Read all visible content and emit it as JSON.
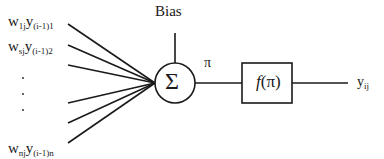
{
  "diagram": {
    "type": "neuron-model",
    "inputs": [
      {
        "weight": "w",
        "weight_sub": "1j",
        "signal": "y",
        "signal_sub": "(i-1)1"
      },
      {
        "weight": "w",
        "weight_sub": "sj",
        "signal": "y",
        "signal_sub": "(i-1)2"
      },
      {
        "weight": "w",
        "weight_sub": "nj",
        "signal": "y",
        "signal_sub": "(i-1)n"
      }
    ],
    "ellipsis": [
      "·",
      "·",
      "·"
    ],
    "bias_label": "Bias",
    "summation_symbol": "Σ",
    "net_label": "π",
    "activation": {
      "func": "f",
      "arg": "(π)"
    },
    "output": {
      "symbol": "y",
      "sub": "ij"
    },
    "line_color": "#1a1a1a"
  }
}
